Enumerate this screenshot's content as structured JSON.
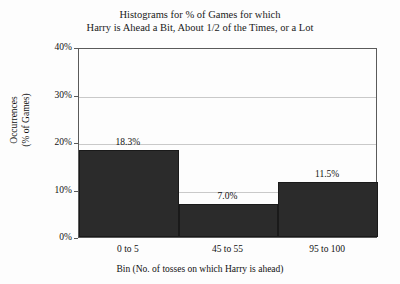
{
  "chart_data": {
    "type": "bar",
    "title": "Histograms for % of Games for which Harry is Ahead a Bit, About 1/2 of the Times, or a Lot",
    "title_lines": [
      "Histograms for % of Games for which",
      "Harry is Ahead a Bit, About 1/2 of the Times, or a Lot"
    ],
    "categories": [
      "0 to 5",
      "45 to 55",
      "95 to 100"
    ],
    "values": [
      18.3,
      7.0,
      11.5
    ],
    "value_labels": [
      "18.3%",
      "7.0%",
      "11.5%"
    ],
    "xlabel": "Bin (No. of tosses on which Harry is ahead)",
    "ylabel": "Occurrences (% of Games)",
    "ylabel_lines": [
      "Occurrences",
      "(% of Games)"
    ],
    "ylim": [
      0,
      40
    ],
    "ytick_values": [
      0,
      10,
      20,
      30,
      40
    ],
    "ytick_labels": [
      "0%",
      "10%",
      "20%",
      "30%",
      "40%"
    ],
    "grid": true,
    "grid_axis": "y",
    "legend": false,
    "bar_color": "#2b2b2b",
    "frame_color": "#5a5a5a",
    "gridline_color": "#c9c9c9",
    "background_color": "#fdfdfd"
  }
}
